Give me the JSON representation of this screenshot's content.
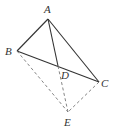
{
  "figure": {
    "points": [
      {
        "id": "A",
        "label": "A"
      },
      {
        "id": "B",
        "label": "B"
      },
      {
        "id": "C",
        "label": "C"
      },
      {
        "id": "D",
        "label": "D"
      },
      {
        "id": "E",
        "label": "E"
      }
    ],
    "segments": {
      "solid": [
        [
          "A",
          "B"
        ],
        [
          "A",
          "C"
        ],
        [
          "B",
          "C"
        ],
        [
          "A",
          "D"
        ]
      ],
      "dashed": [
        [
          "B",
          "E"
        ],
        [
          "C",
          "E"
        ],
        [
          "D",
          "E"
        ]
      ]
    }
  }
}
